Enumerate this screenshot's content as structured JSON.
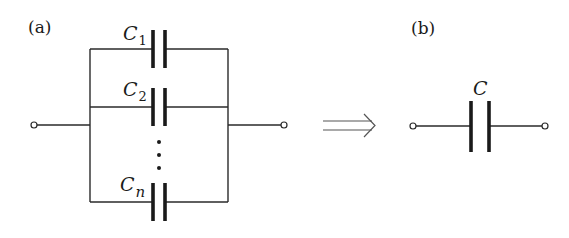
{
  "figure": {
    "panel_a": {
      "label": "(a)",
      "description": "n capacitors connected in parallel",
      "capacitors": [
        {
          "symbol": "C",
          "subscript": "1"
        },
        {
          "symbol": "C",
          "subscript": "2"
        },
        {
          "symbol": "C",
          "subscript": "n"
        }
      ],
      "ellipsis": "⋮"
    },
    "arrow": {
      "symbol": "⟹",
      "meaning": "equivalent to"
    },
    "panel_b": {
      "label": "(b)",
      "description": "equivalent single capacitor",
      "capacitor": {
        "symbol": "C"
      }
    },
    "colors": {
      "line": "#2a2a2a",
      "background": "#ffffff"
    }
  }
}
